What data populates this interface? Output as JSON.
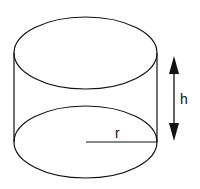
{
  "diagram": {
    "type": "cylinder",
    "labels": {
      "height": "h",
      "radius": "r"
    },
    "colors": {
      "stroke": "#111111",
      "background": "#ffffff"
    }
  }
}
